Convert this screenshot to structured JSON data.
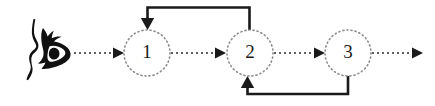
{
  "diagram": {
    "background_color": "#ffffff",
    "node_stroke_color": "#8c8c8c",
    "flow_color": "#2b2b2b",
    "feedback_color": "#1a1a1a",
    "label_color": "#1a1a1a",
    "observer": {
      "icon": "eye-profile-icon",
      "description": "Side profile of a face with an eye"
    },
    "nodes": [
      {
        "id": "node-1",
        "label": "1",
        "cx": 147,
        "cy": 53,
        "r": 23
      },
      {
        "id": "node-2",
        "label": "2",
        "cx": 250,
        "cy": 53,
        "r": 23
      },
      {
        "id": "node-3",
        "label": "3",
        "cx": 348,
        "cy": 53,
        "r": 23
      }
    ],
    "flow_edges": [
      {
        "id": "edge-observer-1",
        "from": "observer",
        "to": "node-1",
        "style": "dotted",
        "arrow": true
      },
      {
        "id": "edge-1-2",
        "from": "node-1",
        "to": "node-2",
        "style": "dotted",
        "arrow": true
      },
      {
        "id": "edge-2-3",
        "from": "node-2",
        "to": "node-3",
        "style": "dotted",
        "arrow": true
      },
      {
        "id": "edge-3-out",
        "from": "node-3",
        "to": "output",
        "style": "dotted",
        "arrow": true
      }
    ],
    "feedback_edges": [
      {
        "id": "feedback-2-to-1",
        "from": "node-2",
        "to": "node-1",
        "style": "solid",
        "routing": "top",
        "arrow": true
      },
      {
        "id": "feedback-3-to-2",
        "from": "node-3",
        "to": "node-2",
        "style": "solid",
        "routing": "bottom",
        "arrow": true
      }
    ]
  }
}
